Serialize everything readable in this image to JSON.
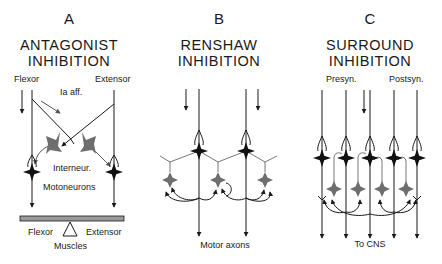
{
  "panels": [
    {
      "letter": "A",
      "title_line1": "ANTAGONIST",
      "title_line2": "INHIBITION",
      "labels": {
        "flexor_top": "Flexor",
        "extensor_top": "Extensor",
        "ia_aff": "Ia aff.",
        "interneur": "Interneur.",
        "motoneurons": "Motoneurons",
        "flexor_bottom": "Flexor",
        "extensor_bottom": "Extensor",
        "muscles": "Muscles"
      }
    },
    {
      "letter": "B",
      "title_line1": "RENSHAW",
      "title_line2": "INHIBITION",
      "labels": {
        "motor_axons": "Motor axons"
      }
    },
    {
      "letter": "C",
      "title_line1": "SURROUND",
      "title_line2": "INHIBITION",
      "labels": {
        "presyn": "Presyn.",
        "postsyn": "Postsyn.",
        "to_cns": "To CNS"
      }
    }
  ],
  "colors": {
    "line": "#1a1a1a",
    "motoneuron": "#111111",
    "interneuron": "#707070",
    "muscle_bar": "#9a9a9a"
  }
}
